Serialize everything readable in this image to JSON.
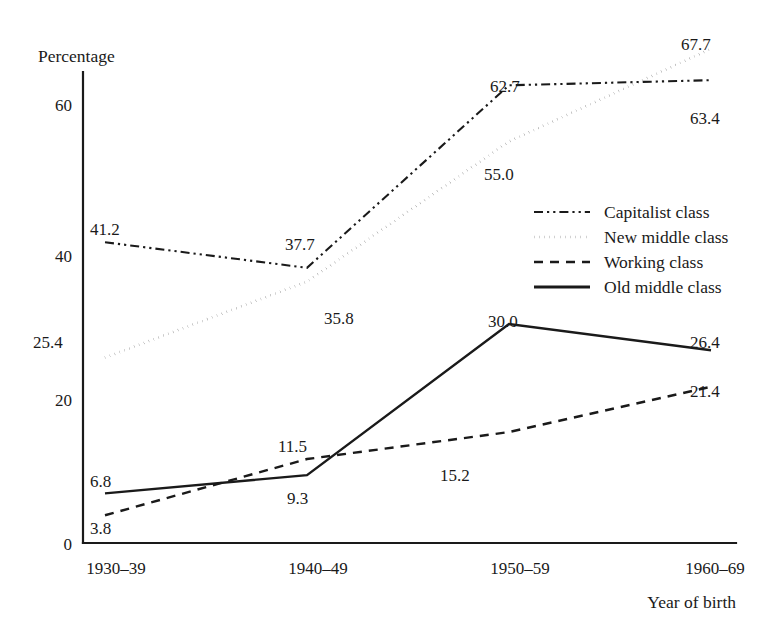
{
  "chart_data": {
    "type": "line",
    "title": "",
    "xlabel": "Year of birth",
    "ylabel": "Percentage",
    "categories": [
      "1930–39",
      "1940–49",
      "1950–59",
      "1960–69"
    ],
    "ylim": [
      0,
      70
    ],
    "yticks": [
      0,
      20,
      40,
      60
    ],
    "ytick_labels": [
      "0",
      "20",
      "40",
      "60"
    ],
    "grid": false,
    "legend_position": "center-right",
    "series": [
      {
        "name": "Capitalist class",
        "style": "dash-dot-dot",
        "values": [
          41.2,
          37.7,
          62.7,
          63.4
        ],
        "labels": [
          "41.2",
          "37.7",
          "62.7",
          "63.4"
        ]
      },
      {
        "name": "New middle class",
        "style": "dotted",
        "values": [
          25.4,
          35.8,
          55.0,
          67.7
        ],
        "labels": [
          "25.4",
          "35.8",
          "55.0",
          "67.7"
        ]
      },
      {
        "name": "Working class",
        "style": "dashed",
        "values": [
          3.8,
          11.5,
          15.2,
          21.4
        ],
        "labels": [
          "3.8",
          "11.5",
          "15.2",
          "21.4"
        ]
      },
      {
        "name": "Old middle class",
        "style": "solid",
        "values": [
          6.8,
          9.3,
          30.0,
          26.4
        ],
        "labels": [
          "6.8",
          "9.3",
          "30.0",
          "26.4"
        ]
      }
    ]
  },
  "axes": {
    "y_title": "Percentage",
    "x_title": "Year of birth",
    "y_ticks": [
      "60",
      "40",
      "20",
      "0"
    ],
    "x_ticks": [
      "1930–39",
      "1940–49",
      "1950–59",
      "1960–69"
    ]
  },
  "legend": {
    "entries": [
      {
        "label": "Capitalist class",
        "style": "dash-dot-dot"
      },
      {
        "label": "New middle class",
        "style": "dotted"
      },
      {
        "label": "Working class",
        "style": "dashed"
      },
      {
        "label": "Old middle class",
        "style": "solid"
      }
    ]
  },
  "value_labels": {
    "capitalist": [
      "41.2",
      "37.7",
      "62.7",
      "63.4"
    ],
    "new_middle": [
      "25.4",
      "35.8",
      "55.0",
      "67.7"
    ],
    "working": [
      "3.8",
      "11.5",
      "15.2",
      "21.4"
    ],
    "old_middle": [
      "6.8",
      "9.3",
      "30.0",
      "26.4"
    ]
  },
  "colors": {
    "ink": "#1a1a1a",
    "background": "#ffffff"
  }
}
